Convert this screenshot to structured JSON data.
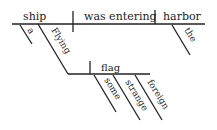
{
  "diagram": {
    "type": "sentence-diagram",
    "main_line": {
      "subject": "ship",
      "verb": "was entering",
      "object": "harbor"
    },
    "modifiers": {
      "subject_article": "a",
      "subject_participle": "Flying",
      "object_article": "the"
    },
    "participle_phrase": {
      "object": "flag",
      "modifiers": [
        "some",
        "strange",
        "foreign"
      ]
    },
    "colors": {
      "ink": "#222222",
      "background": "#ffffff"
    }
  }
}
